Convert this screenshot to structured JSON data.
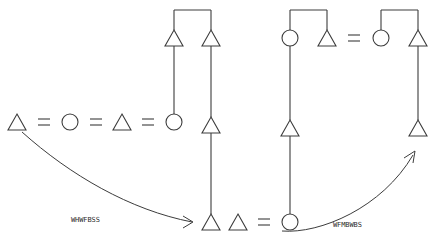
{
  "figure": {
    "title": "",
    "background_color": "#ffffff",
    "stroke_color": "#3c3c3c",
    "label_color": "#2b2b2b",
    "width": 439,
    "height": 250
  },
  "edge_labels": {
    "left": "WHWFBSS",
    "right": "WFMBWBS"
  },
  "symbols": {
    "triangle": "triangle-node",
    "circle": "circle-node",
    "equals": "equals-sign",
    "arrow": "curved-arrow"
  },
  "rows": {
    "middle_left_sequence": [
      "triangle",
      "=",
      "circle",
      "=",
      "triangle",
      "=",
      "circle"
    ],
    "bottom_middle_sequence": [
      "triangle",
      "triangle",
      "=",
      "circle"
    ],
    "top_right_sequence": [
      "circle",
      "triangle",
      "=",
      "circle",
      "triangle"
    ]
  },
  "nodes": [
    {
      "id": "n1",
      "shape": "triangle",
      "cx": 17,
      "cy": 122
    },
    {
      "id": "n2",
      "shape": "circle",
      "cx": 70,
      "cy": 122
    },
    {
      "id": "n3",
      "shape": "triangle",
      "cx": 122,
      "cy": 122
    },
    {
      "id": "n4",
      "shape": "circle",
      "cx": 174,
      "cy": 122
    },
    {
      "id": "n5",
      "shape": "triangle",
      "cx": 174,
      "cy": 38
    },
    {
      "id": "n6",
      "shape": "triangle",
      "cx": 211,
      "cy": 38
    },
    {
      "id": "n7",
      "shape": "triangle",
      "cx": 211,
      "cy": 125
    },
    {
      "id": "n8",
      "shape": "triangle",
      "cx": 211,
      "cy": 222
    },
    {
      "id": "n9",
      "shape": "triangle",
      "cx": 238,
      "cy": 222
    },
    {
      "id": "n10",
      "shape": "circle",
      "cx": 290,
      "cy": 222
    },
    {
      "id": "n11",
      "shape": "triangle",
      "cx": 290,
      "cy": 128
    },
    {
      "id": "n12",
      "shape": "circle",
      "cx": 290,
      "cy": 38
    },
    {
      "id": "n13",
      "shape": "triangle",
      "cx": 327,
      "cy": 38
    },
    {
      "id": "n14",
      "shape": "circle",
      "cx": 381,
      "cy": 38
    },
    {
      "id": "n15",
      "shape": "triangle",
      "cx": 418,
      "cy": 38
    },
    {
      "id": "n16",
      "shape": "triangle",
      "cx": 418,
      "cy": 128
    }
  ],
  "equals_signs": [
    {
      "id": "eq1",
      "cx": 44,
      "cy": 122
    },
    {
      "id": "eq2",
      "cx": 96,
      "cy": 122
    },
    {
      "id": "eq3",
      "cx": 148,
      "cy": 122
    },
    {
      "id": "eq4",
      "cx": 264,
      "cy": 222
    },
    {
      "id": "eq5",
      "cx": 354,
      "cy": 38
    }
  ],
  "counts": {
    "nodes": 16,
    "equals": 5,
    "arrows": 2
  }
}
